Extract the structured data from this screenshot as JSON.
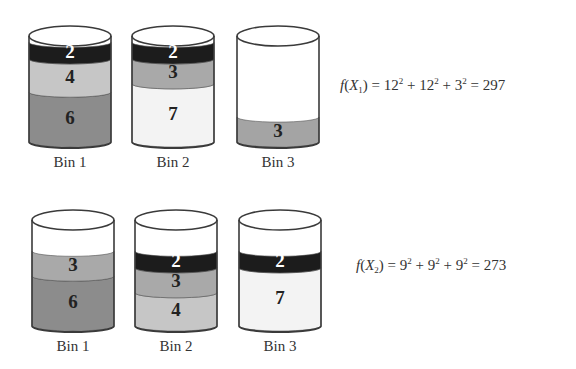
{
  "colors": {
    "outline": "#3a3a3a",
    "layer_2": "#1c1c1c",
    "layer_3": "#a9a9a9",
    "layer_4": "#c6c6c6",
    "layer_6": "#8c8c8c",
    "layer_7": "#f3f3f3",
    "layer_3_solo": "#a4a4a4"
  },
  "solutions": [
    {
      "id": "X1",
      "formula": {
        "lhs": "f",
        "var": "X",
        "sub": "1",
        "terms": [
          {
            "base": "12",
            "exp": "2"
          },
          {
            "base": "12",
            "exp": "2"
          },
          {
            "base": "3",
            "exp": "2"
          }
        ],
        "result": "297"
      },
      "bins": [
        {
          "label": "Bin 1",
          "layers_top_to_bottom": [
            "2",
            "4",
            "6"
          ],
          "total": 12
        },
        {
          "label": "Bin 2",
          "layers_top_to_bottom": [
            "2",
            "3",
            "7"
          ],
          "total": 12
        },
        {
          "label": "Bin 3",
          "layers_top_to_bottom": [
            "3"
          ],
          "total": 3
        }
      ]
    },
    {
      "id": "X2",
      "formula": {
        "lhs": "f",
        "var": "X",
        "sub": "2",
        "terms": [
          {
            "base": "9",
            "exp": "2"
          },
          {
            "base": "9",
            "exp": "2"
          },
          {
            "base": "9",
            "exp": "2"
          }
        ],
        "result": "273"
      },
      "bins": [
        {
          "label": "Bin 1",
          "layers_top_to_bottom": [
            "3",
            "6"
          ],
          "total": 9
        },
        {
          "label": "Bin 2",
          "layers_top_to_bottom": [
            "2",
            "3",
            "4"
          ],
          "total": 9
        },
        {
          "label": "Bin 3",
          "layers_top_to_bottom": [
            "2",
            "7"
          ],
          "total": 9
        }
      ]
    }
  ]
}
